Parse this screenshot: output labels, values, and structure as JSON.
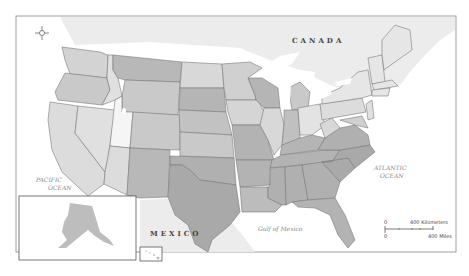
{
  "map": {
    "labels": {
      "canada": "CANADA",
      "mexico": "MEXICO",
      "pacific_line1": "PACIFIC",
      "pacific_line2": "OCEAN",
      "atlantic_line1": "ATLANTIC",
      "atlantic_line2": "OCEAN",
      "gulf": "Gulf   of   Mexico"
    },
    "scale_bar": {
      "km_zero": "0",
      "km_label": "400 Kilometers",
      "mi_zero": "0",
      "mi_label": "400 Miles"
    },
    "icons": {
      "compass": "compass-rose-icon"
    },
    "colors": {
      "land_light": "#e6e6e6",
      "land_mid": "#c9c9c9",
      "land_dark": "#a9a9a9",
      "land_lightest": "#f2f2f2",
      "foreign": "#ececec",
      "water": "#ffffff",
      "border": "#7a7a7a"
    }
  }
}
